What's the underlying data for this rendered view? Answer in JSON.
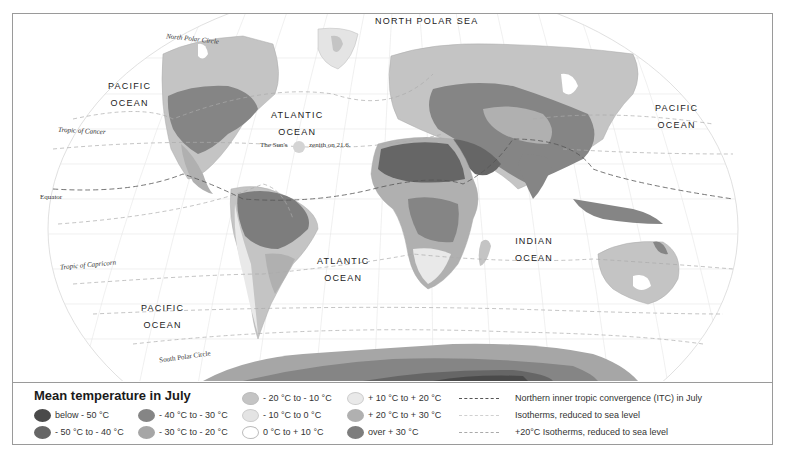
{
  "map": {
    "title": "Mean temperature in July",
    "labels": {
      "north_polar_sea": "NORTH POLAR SEA",
      "pacific_nw_1": "PACIFIC",
      "pacific_nw_2": "OCEAN",
      "atlantic_n_1": "ATLANTIC",
      "atlantic_n_2": "OCEAN",
      "pacific_ne_1": "PACIFIC",
      "pacific_ne_2": "OCEAN",
      "atlantic_s_1": "ATLANTIC",
      "atlantic_s_2": "OCEAN",
      "indian_1": "INDIAN",
      "indian_2": "OCEAN",
      "pacific_s_1": "PACIFIC",
      "pacific_s_2": "OCEAN",
      "north_polar_circle": "North Polar Circle",
      "tropic_of_cancer": "Tropic of Cancer",
      "equator": "Equator",
      "tropic_of_capricorn": "Tropic of Capricorn",
      "south_polar_circle": "South Polar Circle",
      "sun_zenith_a": "The Sun's",
      "sun_zenith_b": "zenith on 21.6."
    }
  },
  "legend": {
    "title": "Mean temperature in July",
    "classes": [
      {
        "label": "below - 50 °C",
        "color": "#4a4a4a"
      },
      {
        "label": "- 50 °C to - 40 °C",
        "color": "#666666"
      },
      {
        "label": "- 40 °C to - 30 °C",
        "color": "#858585"
      },
      {
        "label": "- 30 °C to - 20 °C",
        "color": "#a6a6a6"
      },
      {
        "label": "- 20 °C to - 10 °C",
        "color": "#c4c4c4"
      },
      {
        "label": "- 10 °C to 0 °C",
        "color": "#e4e4e4"
      },
      {
        "label": "0 °C to + 10 °C",
        "color": "#ffffff"
      },
      {
        "label": "+ 10 °C to + 20 °C",
        "color": "#e9e9e9"
      },
      {
        "label": "+ 20 °C to + 30 °C",
        "color": "#b0b0b0"
      },
      {
        "label": "over + 30 °C",
        "color": "#7d7d7d"
      }
    ],
    "lines": [
      {
        "label": "Northern inner tropic convergence (ITC) in July",
        "style": "dashed-dark"
      },
      {
        "label": "Isotherms, reduced to sea level",
        "style": "dashed-light"
      },
      {
        "label": "+20°C Isotherms, reduced to sea level",
        "style": "dashed-medium"
      }
    ]
  }
}
